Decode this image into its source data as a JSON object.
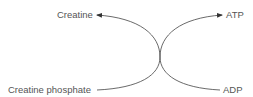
{
  "diagram": {
    "labels": {
      "creatine": "Creatine",
      "creatine_phosphate": "Creatine phosphate",
      "atp": "ATP",
      "adp": "ADP"
    },
    "arrows": [
      {
        "from": "Creatine phosphate",
        "to": "Creatine"
      },
      {
        "from": "ADP",
        "to": "ATP"
      }
    ],
    "line_color": "#444444",
    "text_color": "#555555"
  }
}
